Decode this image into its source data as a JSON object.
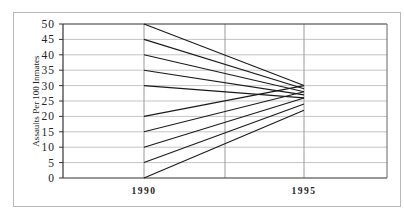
{
  "chart_data": {
    "type": "line",
    "title": "",
    "xlabel": "",
    "ylabel": "Assaults Per 100 Inmates",
    "x": [
      "1990",
      "1995"
    ],
    "ylim": [
      0,
      50
    ],
    "yticks": [
      0,
      5,
      10,
      15,
      20,
      25,
      30,
      35,
      40,
      45,
      50
    ],
    "grid": true,
    "legend": null,
    "series": [
      {
        "name": "line-1",
        "values": [
          50,
          30
        ]
      },
      {
        "name": "line-2",
        "values": [
          45,
          29
        ]
      },
      {
        "name": "line-3",
        "values": [
          40,
          28
        ]
      },
      {
        "name": "line-4",
        "values": [
          35,
          27
        ]
      },
      {
        "name": "line-5",
        "values": [
          30,
          26
        ]
      },
      {
        "name": "line-6",
        "values": [
          20,
          30
        ]
      },
      {
        "name": "line-7",
        "values": [
          15,
          28
        ]
      },
      {
        "name": "line-8",
        "values": [
          10,
          26
        ]
      },
      {
        "name": "line-9",
        "values": [
          5,
          24
        ]
      },
      {
        "name": "line-10",
        "values": [
          0,
          22
        ]
      }
    ]
  },
  "axis": {
    "ylabel": "Assaults Per 100 Inmates",
    "yticks": [
      "0",
      "5",
      "10",
      "15",
      "20",
      "25",
      "30",
      "35",
      "40",
      "45",
      "50"
    ],
    "xticks": [
      "1990",
      "1995"
    ]
  }
}
